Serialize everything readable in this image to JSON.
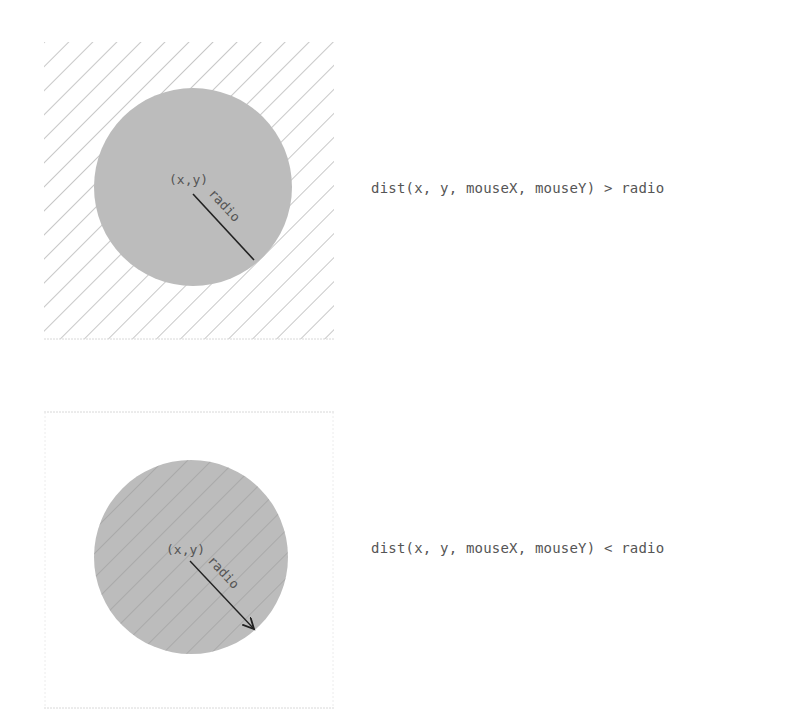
{
  "diagrams": [
    {
      "id": "outside",
      "center_label": "(x,y)",
      "radius_label": "radio",
      "formula": "dist(x, y, mouseX, mouseY) > radio",
      "hatch_region": "outside-circle",
      "radius_style": "line"
    },
    {
      "id": "inside",
      "center_label": "(x,y)",
      "radius_label": "radio",
      "formula": "dist(x, y, mouseX, mouseY) < radio",
      "hatch_region": "inside-circle",
      "radius_style": "arrow"
    }
  ],
  "colors": {
    "circle_fill": "#bcbcbc",
    "hatch": "#9a9a9a",
    "border": "#d8d8d8",
    "text": "#555555",
    "radius_line": "#222222"
  }
}
